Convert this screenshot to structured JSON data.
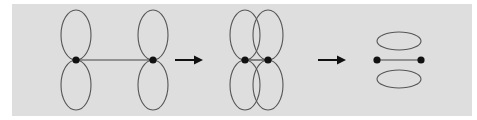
{
  "diagram": {
    "title": "",
    "background_color": "#dedede",
    "stroke_color": "#555555",
    "dot_color": "#111111",
    "arrow_color": "#111111",
    "stages": [
      {
        "name": "separated-p-orbitals",
        "atoms": [
          {
            "x": 76,
            "y": 60
          },
          {
            "x": 153,
            "y": 60
          }
        ],
        "lobes": [
          {
            "cx": 76,
            "cy": 35,
            "rx": 15,
            "ry": 25
          },
          {
            "cx": 76,
            "cy": 85,
            "rx": 15,
            "ry": 25
          },
          {
            "cx": 153,
            "cy": 35,
            "rx": 15,
            "ry": 25
          },
          {
            "cx": 153,
            "cy": 85,
            "rx": 15,
            "ry": 25
          }
        ]
      },
      {
        "name": "overlapping-p-orbitals",
        "atoms": [
          {
            "x": 245,
            "y": 60
          },
          {
            "x": 268,
            "y": 60
          }
        ],
        "lobes": [
          {
            "cx": 245,
            "cy": 35,
            "rx": 15,
            "ry": 25
          },
          {
            "cx": 245,
            "cy": 85,
            "rx": 15,
            "ry": 25
          },
          {
            "cx": 268,
            "cy": 35,
            "rx": 15,
            "ry": 25
          },
          {
            "cx": 268,
            "cy": 85,
            "rx": 15,
            "ry": 25
          }
        ]
      },
      {
        "name": "pi-bond",
        "atoms": [
          {
            "x": 377,
            "y": 60
          },
          {
            "x": 421,
            "y": 60
          }
        ],
        "lobes": [
          {
            "cx": 399,
            "cy": 41,
            "rx": 22,
            "ry": 9
          },
          {
            "cx": 399,
            "cy": 79,
            "rx": 22,
            "ry": 9
          }
        ]
      }
    ],
    "arrows": [
      {
        "x1": 175,
        "x2": 202,
        "y": 60
      },
      {
        "x1": 318,
        "x2": 346,
        "y": 60
      }
    ]
  }
}
